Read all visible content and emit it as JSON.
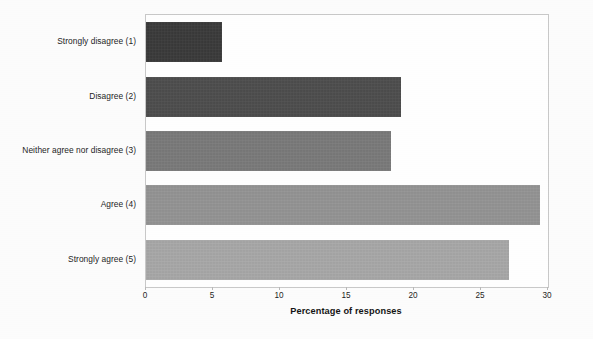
{
  "chart_data": {
    "type": "bar",
    "orientation": "horizontal",
    "title": "",
    "xlabel": "Percentage of responses",
    "ylabel": "",
    "xlim": [
      0,
      30
    ],
    "xticks": [
      0,
      5,
      10,
      15,
      20,
      25,
      30
    ],
    "xtick_labels": [
      "0",
      "5",
      "10",
      "15",
      "20",
      "25",
      "30"
    ],
    "grid": false,
    "legend": "none",
    "categories": [
      "Strongly disagree (1)",
      "Disagree (2)",
      "Neither agree nor disagree (3)",
      "Agree (4)",
      "Strongly agree (5)"
    ],
    "values": [
      5.7,
      19.0,
      18.3,
      29.4,
      27.1
    ],
    "bar_colors": [
      "#3a3a3a",
      "#4d4d4d",
      "#7a7a7a",
      "#949494",
      "#a8a8a8"
    ],
    "series": [
      {
        "name": "Percentage of responses",
        "values": [
          5.7,
          19.0,
          18.3,
          29.4,
          27.1
        ]
      }
    ]
  },
  "axis": {
    "value_axis_title": "Percentage of responses"
  }
}
